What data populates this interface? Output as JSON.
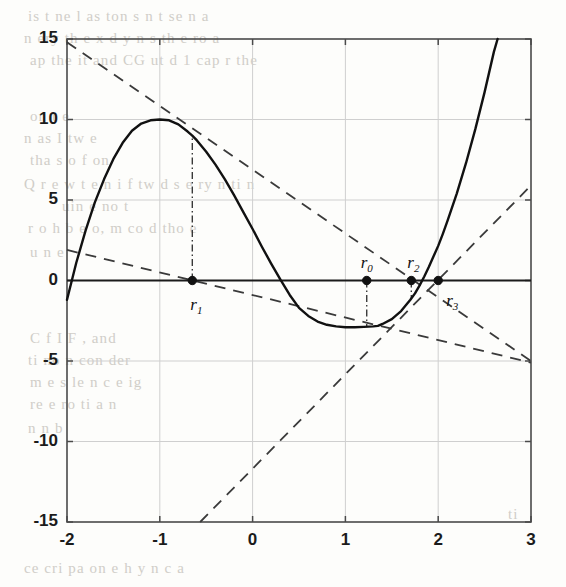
{
  "page": {
    "kind": "scanned-textbook-figure",
    "bleed_text": [
      {
        "t": "is  t    ne  l  as    ton      s     n   t   se  n  a",
        "x": 28,
        "y": 8
      },
      {
        "t": "n     ery  th    e  x  d  y      n  s  th     e  ro a",
        "x": 24,
        "y": 30
      },
      {
        "t": "ap   the   it  and  CG  ut  d  1   cap  r   the",
        "x": 30,
        "y": 52
      },
      {
        "t": "on  t  e",
        "x": 30,
        "y": 108
      },
      {
        "t": "n        as  I  tw   e",
        "x": 24,
        "y": 130
      },
      {
        "t": "tha  s  o    f   on",
        "x": 30,
        "y": 152
      },
      {
        "t": "Q   r   e      w  t   e   n   i  f  tw   d   s   e   ry   n   ti  n",
        "x": 24,
        "y": 176
      },
      {
        "t": "uin   e  no  t",
        "x": 62,
        "y": 198
      },
      {
        "t": "r  o  h  b   e  o,    m    co  d  tho  e",
        "x": 28,
        "y": 220
      },
      {
        "t": "u       n  e",
        "x": 30,
        "y": 244
      },
      {
        "t": "C          f  I  F  ,   and",
        "x": 30,
        "y": 330
      },
      {
        "t": "ti     no     n     con  der",
        "x": 28,
        "y": 352
      },
      {
        "t": "m    e    s    le  n  c  e    ig",
        "x": 30,
        "y": 374
      },
      {
        "t": "re       e      ro      ti    a  n",
        "x": 30,
        "y": 396
      },
      {
        "t": "n   n  b",
        "x": 28,
        "y": 420
      },
      {
        "t": "ti",
        "x": 508,
        "y": 506
      },
      {
        "t": "ce  cri   pa   on   e    h  y  n    c   a",
        "x": 24,
        "y": 560
      }
    ]
  },
  "chart_data": {
    "type": "line",
    "title": "",
    "xlabel": "",
    "ylabel": "",
    "xlim": [
      -2,
      3
    ],
    "ylim": [
      -15,
      15
    ],
    "xticks": [
      -2,
      -1,
      0,
      1,
      2,
      3
    ],
    "xticklabels": [
      "-2",
      "-1",
      "0",
      "1",
      "2",
      "3"
    ],
    "yticks": [
      -15,
      -10,
      -5,
      0,
      5,
      10,
      15
    ],
    "yticklabels": [
      "-15",
      "-10",
      "-5",
      "0",
      "5",
      "10",
      "15"
    ],
    "grid": true,
    "legend": null,
    "series": [
      {
        "name": "f(x)",
        "style": "solid",
        "linewidth": 2.4,
        "color": "#111111",
        "points": [
          [
            -2.0,
            -1.2
          ],
          [
            -1.9,
            1.1
          ],
          [
            -1.8,
            3.1
          ],
          [
            -1.7,
            4.85
          ],
          [
            -1.6,
            6.3
          ],
          [
            -1.5,
            7.55
          ],
          [
            -1.4,
            8.55
          ],
          [
            -1.3,
            9.3
          ],
          [
            -1.2,
            9.75
          ],
          [
            -1.1,
            9.95
          ],
          [
            -1.0,
            10.0
          ],
          [
            -0.9,
            9.95
          ],
          [
            -0.8,
            9.7
          ],
          [
            -0.7,
            9.25
          ],
          [
            -0.65,
            9.0
          ],
          [
            -0.6,
            8.7
          ],
          [
            -0.5,
            8.0
          ],
          [
            -0.4,
            7.2
          ],
          [
            -0.3,
            6.3
          ],
          [
            -0.2,
            5.3
          ],
          [
            -0.1,
            4.25
          ],
          [
            0.0,
            3.2
          ],
          [
            0.1,
            2.1
          ],
          [
            0.2,
            1.05
          ],
          [
            0.3,
            0.05
          ],
          [
            0.4,
            -0.9
          ],
          [
            0.5,
            -1.7
          ],
          [
            0.6,
            -2.2
          ],
          [
            0.7,
            -2.55
          ],
          [
            0.8,
            -2.75
          ],
          [
            0.9,
            -2.85
          ],
          [
            1.0,
            -2.9
          ],
          [
            1.1,
            -2.9
          ],
          [
            1.2,
            -2.88
          ],
          [
            1.3,
            -2.85
          ],
          [
            1.35,
            -2.82
          ],
          [
            1.4,
            -2.7
          ],
          [
            1.5,
            -2.4
          ],
          [
            1.6,
            -1.9
          ],
          [
            1.7,
            -1.2
          ],
          [
            1.75,
            -0.8
          ],
          [
            1.8,
            -0.3
          ],
          [
            1.85,
            0.25
          ],
          [
            1.9,
            0.85
          ],
          [
            1.95,
            1.5
          ],
          [
            2.0,
            2.15
          ],
          [
            2.05,
            2.9
          ],
          [
            2.1,
            3.7
          ],
          [
            2.2,
            5.4
          ],
          [
            2.3,
            7.3
          ],
          [
            2.4,
            9.4
          ],
          [
            2.5,
            11.7
          ],
          [
            2.6,
            14.2
          ],
          [
            2.64,
            15.0
          ]
        ]
      }
    ],
    "dashed_lines": [
      {
        "name": "tangent-at-r1",
        "style": "dashed",
        "from": [
          -2.0,
          14.8
        ],
        "to": [
          3.0,
          -5.0
        ],
        "color": "#3a3a3a"
      },
      {
        "name": "secant-through-r1",
        "style": "dashed",
        "from": [
          -2.0,
          1.9
        ],
        "to": [
          3.0,
          -5.1
        ],
        "color": "#3a3a3a"
      },
      {
        "name": "tangent-at-r2",
        "style": "dashed",
        "from": [
          -0.565,
          -15.0
        ],
        "to": [
          3.0,
          5.9
        ],
        "color": "#3a3a3a"
      }
    ],
    "dashdot_drop_lines": [
      {
        "name": "drop-line-r1",
        "x": -0.65,
        "y0": 0.0,
        "y1": 9.0
      },
      {
        "name": "drop-line-r0",
        "x": 1.23,
        "y0": 0.0,
        "y1": -2.88
      },
      {
        "name": "drop-line-r2",
        "x": 1.71,
        "y0": 0.0,
        "y1": -1.15
      }
    ],
    "markers": [
      {
        "name": "r1",
        "label": "r",
        "sub": "1",
        "x": -0.65,
        "y": 0.0,
        "label_dx": -2,
        "label_dy": 14
      },
      {
        "name": "r0",
        "label": "r",
        "sub": "0",
        "x": 1.23,
        "y": 0.0,
        "label_dx": -6,
        "label_dy": -28
      },
      {
        "name": "r2",
        "label": "r",
        "sub": "2",
        "x": 1.71,
        "y": 0.0,
        "label_dx": -4,
        "label_dy": -28
      },
      {
        "name": "r3",
        "label": "r",
        "sub": "3",
        "x": 2.0,
        "y": 0.0,
        "label_dx": 8,
        "label_dy": 10
      }
    ],
    "zero_line": {
      "name": "x-axis-zero-line",
      "y": 0.0
    }
  }
}
